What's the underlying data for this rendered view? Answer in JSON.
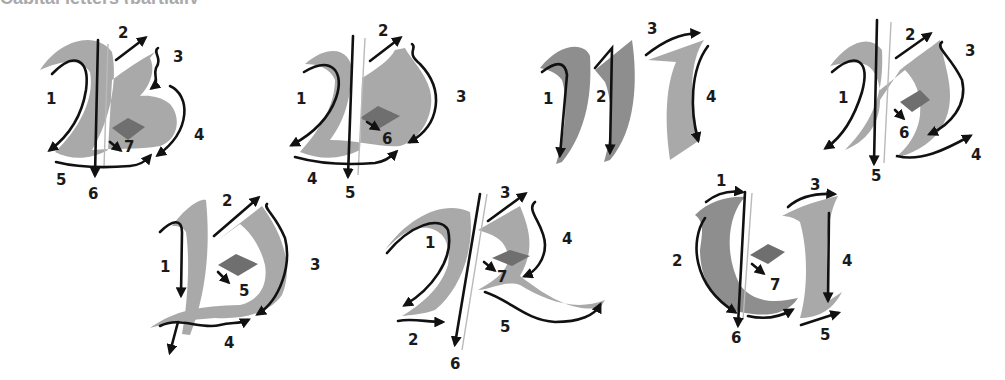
{
  "title": "Capital letters (partially cropped)",
  "figure": {
    "type": "calligraphy stroke-order diagram",
    "ink_color": "#111111",
    "brush_color": "#a9a9a9",
    "guide_color": "#b9b9b9"
  },
  "letters": [
    {
      "letter": "B",
      "row": 1,
      "strokes": [
        "1",
        "2",
        "3",
        "4",
        "5",
        "6",
        "7"
      ]
    },
    {
      "letter": "D",
      "row": 1,
      "strokes": [
        "1",
        "2",
        "3",
        "4",
        "5",
        "6"
      ]
    },
    {
      "letter": "M",
      "row": 1,
      "strokes": [
        "1",
        "2",
        "3",
        "4"
      ]
    },
    {
      "letter": "N",
      "row": 1,
      "strokes": [
        "1",
        "2",
        "3",
        "4",
        "5",
        "6"
      ]
    },
    {
      "letter": "P",
      "row": 2,
      "strokes": [
        "1",
        "2",
        "3",
        "4",
        "5"
      ]
    },
    {
      "letter": "R",
      "row": 2,
      "strokes": [
        "1",
        "2",
        "3",
        "4",
        "5",
        "6",
        "7"
      ]
    },
    {
      "letter": "U",
      "row": 2,
      "strokes": [
        "1",
        "2",
        "3",
        "4",
        "5",
        "6",
        "7"
      ]
    }
  ],
  "labels": {
    "b": [
      "1",
      "2",
      "3",
      "4",
      "5",
      "6",
      "7"
    ],
    "d": [
      "1",
      "2",
      "3",
      "4",
      "5",
      "6"
    ],
    "m": [
      "1",
      "2",
      "3",
      "4"
    ],
    "n": [
      "1",
      "2",
      "3",
      "4",
      "5",
      "6"
    ],
    "p": [
      "1",
      "2",
      "3",
      "4",
      "5"
    ],
    "r": [
      "1",
      "2",
      "3",
      "4",
      "5",
      "6",
      "7"
    ],
    "u": [
      "1",
      "2",
      "3",
      "4",
      "5",
      "6",
      "7"
    ]
  }
}
